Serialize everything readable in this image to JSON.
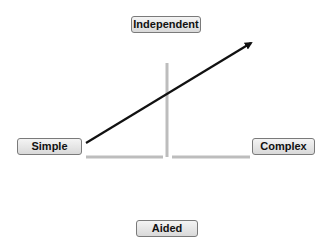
{
  "diagram": {
    "labels": {
      "top": "Independent",
      "left": "Simple",
      "right": "Complex",
      "bottom": "Aided"
    },
    "colors": {
      "axis": "#bdbdbd",
      "arrow": "#111111",
      "label_border": "#7a7a7a",
      "label_fill": "#e6e6e6"
    }
  }
}
